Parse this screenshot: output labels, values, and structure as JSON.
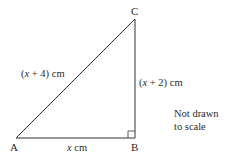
{
  "figure": {
    "type": "right-triangle",
    "vertices": [
      {
        "name": "A"
      },
      {
        "name": "B"
      },
      {
        "name": "C"
      }
    ],
    "right_angle_at": "B",
    "sides": {
      "AC": {
        "label_prefix": "(",
        "var": "x",
        "label_suffix": " + 4) cm"
      },
      "BC": {
        "label_prefix": "(",
        "var": "x",
        "label_suffix": " + 2) cm"
      },
      "AB": {
        "var": "x",
        "label_suffix": " cm"
      }
    },
    "note": {
      "line1": "Not drawn",
      "line2": "to scale"
    }
  }
}
